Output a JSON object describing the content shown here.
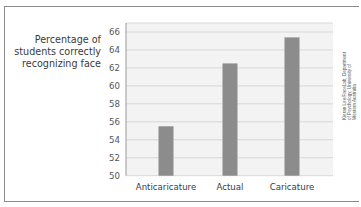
{
  "chart_data": {
    "type": "bar",
    "title": "",
    "xlabel": "",
    "ylabel": "Percentage of students correctly recognizing face",
    "ylabel_lines": [
      "Percentage of",
      "students correctly",
      "recognizing face"
    ],
    "categories": [
      "Anticaricature",
      "Actual",
      "Caricature"
    ],
    "values": [
      55.5,
      62.5,
      65.4
    ],
    "ylim": [
      50,
      67
    ],
    "yticks": [
      50,
      52,
      54,
      56,
      58,
      60,
      62,
      64,
      66
    ],
    "grid": true,
    "bar_color": "#8c8c8c",
    "grid_color": "#d0d0d0",
    "plot_background": "#f3f3f3",
    "credit": [
      "Kieran Lee/FaceLab, Department",
      "of Psychology, University of",
      "Western Australia"
    ]
  }
}
